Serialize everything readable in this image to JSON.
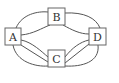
{
  "diagram": {
    "type": "multigraph",
    "nodes": [
      {
        "id": "A",
        "label": "A"
      },
      {
        "id": "B",
        "label": "B"
      },
      {
        "id": "C",
        "label": "C"
      },
      {
        "id": "D",
        "label": "D"
      }
    ],
    "edges": [
      {
        "from": "A",
        "to": "B",
        "count": 2
      },
      {
        "from": "A",
        "to": "C",
        "count": 3
      },
      {
        "from": "B",
        "to": "D",
        "count": 2
      },
      {
        "from": "C",
        "to": "D",
        "count": 3
      }
    ],
    "colors": {
      "stroke": "#444444",
      "node_fill": "#ffffff",
      "label": "#333333"
    }
  }
}
